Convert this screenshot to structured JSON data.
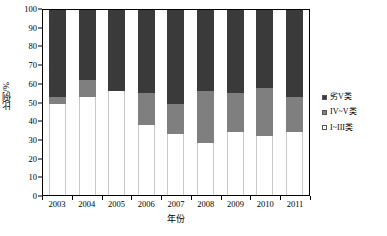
{
  "chart_data": {
    "type": "bar",
    "stacked": true,
    "title": "",
    "xlabel": "年份",
    "ylabel": "比例/%",
    "ylim": [
      0,
      100
    ],
    "yticks": [
      0,
      10,
      20,
      30,
      40,
      50,
      60,
      70,
      80,
      90,
      100
    ],
    "ytick_labels": [
      "0",
      "10",
      "20",
      "30",
      "40",
      "50",
      "60",
      "70",
      "80",
      "90",
      "100"
    ],
    "grid": false,
    "legend_position": "right",
    "categories": [
      "2003",
      "2004",
      "2005",
      "2006",
      "2007",
      "2008",
      "2009",
      "2010",
      "2011"
    ],
    "series": [
      {
        "name": "劣V类",
        "color": "#3a3a3a",
        "values": [
          47,
          38,
          44,
          45,
          51,
          44,
          45,
          42,
          47
        ]
      },
      {
        "name": "IV~V类",
        "color": "#7f7f7f",
        "values": [
          4,
          9,
          0,
          17,
          16,
          28,
          21,
          26,
          19
        ]
      },
      {
        "name": "I~III类",
        "color": "#ffffff",
        "values": [
          49,
          53,
          56,
          38,
          33,
          28,
          34,
          32,
          34
        ]
      }
    ]
  },
  "axis": {
    "y_title": "比例/%",
    "x_title": "年份"
  },
  "legend": {
    "items": [
      {
        "label": "劣V类",
        "color": "#3a3a3a"
      },
      {
        "label": "IV~V类",
        "color": "#7f7f7f"
      },
      {
        "label": "I~III类",
        "color": "#ffffff"
      }
    ]
  }
}
